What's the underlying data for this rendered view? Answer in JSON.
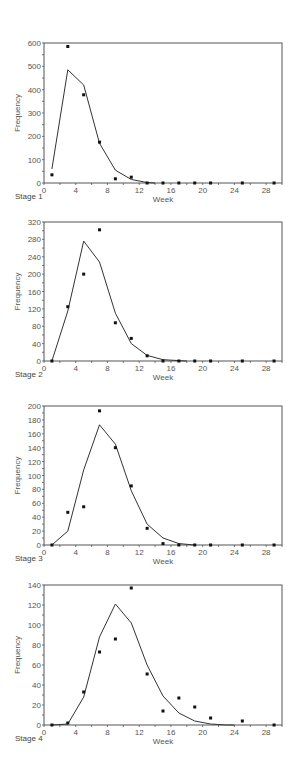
{
  "chart_data": [
    {
      "type": "line",
      "title": "Stage 1",
      "xlabel": "Week",
      "ylabel": "Frequency",
      "xlim": [
        0,
        30
      ],
      "ylim": [
        0,
        600
      ],
      "xticks": [
        0,
        4,
        8,
        12,
        16,
        20,
        24,
        28
      ],
      "yticks": [
        0,
        100,
        200,
        300,
        400,
        500,
        600
      ],
      "series": [
        {
          "name": "observed",
          "style": "scatter",
          "x": [
            1,
            3,
            5,
            7,
            9,
            11,
            13,
            15,
            17,
            19,
            21,
            25,
            29
          ],
          "values": [
            35,
            585,
            378,
            175,
            18,
            25,
            0,
            0,
            0,
            0,
            0,
            0,
            0
          ]
        },
        {
          "name": "fitted",
          "style": "line",
          "x": [
            1,
            3,
            5,
            7,
            9,
            11,
            13,
            14
          ],
          "values": [
            60,
            485,
            420,
            170,
            55,
            15,
            2,
            0
          ]
        }
      ]
    },
    {
      "type": "line",
      "title": "Stage 2",
      "xlabel": "Week",
      "ylabel": "Frequency",
      "xlim": [
        0,
        30
      ],
      "ylim": [
        0,
        320
      ],
      "xticks": [
        0,
        4,
        8,
        12,
        16,
        20,
        24,
        28
      ],
      "yticks": [
        0,
        40,
        80,
        120,
        160,
        200,
        240,
        280,
        320
      ],
      "series": [
        {
          "name": "observed",
          "style": "scatter",
          "x": [
            1,
            3,
            5,
            7,
            9,
            11,
            13,
            15,
            17,
            19,
            21,
            25,
            29
          ],
          "values": [
            0,
            125,
            200,
            302,
            88,
            52,
            12,
            0,
            0,
            0,
            0,
            0,
            0
          ]
        },
        {
          "name": "fitted",
          "style": "line",
          "x": [
            1,
            3,
            5,
            7,
            9,
            11,
            13,
            15,
            17,
            18
          ],
          "values": [
            0,
            115,
            276,
            228,
            110,
            40,
            13,
            3,
            1,
            0
          ]
        }
      ]
    },
    {
      "type": "line",
      "title": "Stage 3",
      "xlabel": "Week",
      "ylabel": "Frequency",
      "xlim": [
        0,
        30
      ],
      "ylim": [
        0,
        200
      ],
      "xticks": [
        0,
        4,
        8,
        12,
        16,
        20,
        24,
        28
      ],
      "yticks": [
        0,
        20,
        40,
        60,
        80,
        100,
        120,
        140,
        160,
        180,
        200
      ],
      "series": [
        {
          "name": "observed",
          "style": "scatter",
          "x": [
            1,
            3,
            5,
            7,
            9,
            11,
            13,
            15,
            17,
            19,
            21,
            25,
            29
          ],
          "values": [
            0,
            47,
            55,
            193,
            140,
            85,
            24,
            2,
            0,
            0,
            0,
            0,
            0
          ]
        },
        {
          "name": "fitted",
          "style": "line",
          "x": [
            1,
            3,
            5,
            7,
            9,
            11,
            13,
            15,
            17,
            19
          ],
          "values": [
            0,
            20,
            108,
            173,
            145,
            78,
            30,
            10,
            2,
            0
          ]
        }
      ]
    },
    {
      "type": "line",
      "title": "Stage 4",
      "xlabel": "Week",
      "ylabel": "Frequency",
      "xlim": [
        0,
        30
      ],
      "ylim": [
        0,
        140
      ],
      "xticks": [
        0,
        4,
        8,
        12,
        16,
        20,
        24,
        28
      ],
      "yticks": [
        0,
        20,
        40,
        60,
        80,
        100,
        120,
        140
      ],
      "series": [
        {
          "name": "observed",
          "style": "scatter",
          "x": [
            1,
            3,
            5,
            7,
            9,
            11,
            13,
            15,
            17,
            19,
            21,
            25,
            29
          ],
          "values": [
            0,
            2,
            33,
            73,
            86,
            137,
            51,
            14,
            27,
            18,
            7,
            4,
            0
          ]
        },
        {
          "name": "fitted",
          "style": "line",
          "x": [
            1,
            3,
            5,
            7,
            9,
            11,
            13,
            15,
            17,
            19,
            21,
            23,
            24
          ],
          "values": [
            0,
            1,
            28,
            88,
            121,
            102,
            60,
            29,
            12,
            4,
            1,
            0,
            0
          ]
        }
      ]
    }
  ],
  "labels": {
    "stage1": "Stage 1",
    "stage2": "Stage 2",
    "stage3": "Stage 3",
    "stage4": "Stage 4",
    "xlabel": "Week",
    "ylabel": "Frequency"
  },
  "colors": {
    "frame": "#555555",
    "line": "#333333",
    "points": "#111111",
    "text": "#555555"
  },
  "layout": [
    {
      "top": 43,
      "bottom": 183,
      "label_y": 199
    },
    {
      "top": 222,
      "bottom": 361,
      "label_y": 377
    },
    {
      "top": 406,
      "bottom": 545,
      "label_y": 561
    },
    {
      "top": 585,
      "bottom": 725,
      "label_y": 741
    }
  ]
}
